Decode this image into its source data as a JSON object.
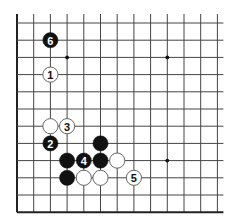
{
  "board": {
    "columns": 13,
    "rows": 12,
    "origin_x": 17,
    "origin_y": 23,
    "spacing_x": 16.7,
    "spacing_y": 17.2,
    "stone_radius": 7.6,
    "edges": {
      "left": "border",
      "bottom": "border",
      "top": "open",
      "right": "open"
    },
    "colors": {
      "line": "#444444",
      "border": "#222222",
      "black_stone": "#111111",
      "white_stone": "#ffffff",
      "white_stone_outline": "#555555",
      "star_point": "#111111"
    },
    "star_points": [
      {
        "col": 3,
        "row": 2
      },
      {
        "col": 9,
        "row": 2
      },
      {
        "col": 9,
        "row": 8
      }
    ],
    "stones": [
      {
        "col": 2,
        "row": 1,
        "color": "black",
        "label": "6"
      },
      {
        "col": 2,
        "row": 3,
        "color": "white",
        "label": "1"
      },
      {
        "col": 2,
        "row": 6,
        "color": "white",
        "label": ""
      },
      {
        "col": 3,
        "row": 6,
        "color": "white",
        "label": "3"
      },
      {
        "col": 2,
        "row": 7,
        "color": "black",
        "label": "2"
      },
      {
        "col": 5,
        "row": 7,
        "color": "black",
        "label": ""
      },
      {
        "col": 3,
        "row": 8,
        "color": "black",
        "label": ""
      },
      {
        "col": 4,
        "row": 8,
        "color": "black",
        "label": "4"
      },
      {
        "col": 5,
        "row": 8,
        "color": "black",
        "label": ""
      },
      {
        "col": 6,
        "row": 8,
        "color": "white",
        "label": ""
      },
      {
        "col": 3,
        "row": 9,
        "color": "black",
        "label": ""
      },
      {
        "col": 4,
        "row": 9,
        "color": "white",
        "label": ""
      },
      {
        "col": 5,
        "row": 9,
        "color": "white",
        "label": ""
      },
      {
        "col": 7,
        "row": 9,
        "color": "white",
        "label": "5"
      }
    ]
  }
}
